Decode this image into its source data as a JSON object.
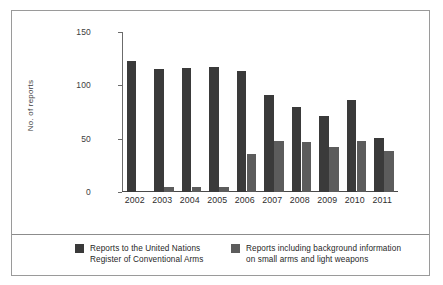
{
  "chart_data": {
    "type": "bar",
    "title": "",
    "xlabel": "",
    "ylabel": "No. of reports",
    "categories": [
      "2002",
      "2003",
      "2004",
      "2005",
      "2006",
      "2007",
      "2008",
      "2009",
      "2010",
      "2011"
    ],
    "series": [
      {
        "name": "Reports to the United Nations Register of Conventional Arms",
        "legend_line_1": "Reports to the United Nations",
        "legend_line_2": "Register of Conventional Arms",
        "color": "#3a3a3a",
        "values": [
          123,
          115,
          116,
          117,
          113,
          91,
          80,
          71,
          86,
          51
        ]
      },
      {
        "name": "Reports including background information on small arms and light weapons",
        "legend_line_1": "Reports including background information",
        "legend_line_2": "on small arms and light weapons",
        "color": "#5c5c5c",
        "values": [
          0,
          5,
          5,
          5,
          36,
          48,
          47,
          42,
          48,
          38
        ]
      }
    ],
    "ylim": [
      0,
      150
    ],
    "yticks": [
      0,
      50,
      100,
      150
    ],
    "ytick_labels": [
      "0",
      "50",
      "100",
      "150"
    ],
    "grid": false,
    "legend_position": "bottom"
  },
  "figure": {
    "border_color": "#9a9a9a",
    "background": "#ffffff",
    "axis_color": "#4a4a4a"
  }
}
